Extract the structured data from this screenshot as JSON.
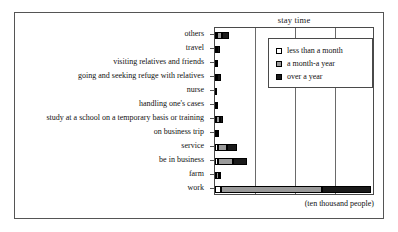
{
  "chart_data": {
    "type": "bar",
    "orientation": "horizontal",
    "stacked": true,
    "title": "stay time",
    "xlabel": "(ten thousand people)",
    "ylabel": "",
    "unit_caption": "(ten thousand people)",
    "grid": true,
    "gridlines_x": [
      0,
      25,
      50,
      75,
      100
    ],
    "xlim": [
      0,
      100
    ],
    "legend_position": "top-right",
    "categories": [
      "others",
      "travel",
      "visiting relatives and friends",
      "going and seeking refuge with relatives",
      "nurse",
      "handling one's cases",
      "study at a school on a temporary basis or training",
      "on business trip",
      "service",
      "be in business",
      "farm",
      "work"
    ],
    "series": [
      {
        "name": "less than a month",
        "color": "#ffffff",
        "values": [
          1.2,
          0.5,
          0.6,
          0.6,
          0.1,
          0.2,
          0.6,
          0.7,
          1.6,
          1.6,
          0.6,
          3.8
        ]
      },
      {
        "name": "a month-a year",
        "color": "#9a9a9a",
        "values": [
          3.2,
          0.6,
          0.2,
          0.9,
          0.1,
          0.2,
          2.3,
          0.3,
          5.9,
          9.6,
          2.0,
          63.0
        ]
      },
      {
        "name": "over a year",
        "color": "#1a1a1a",
        "values": [
          4.2,
          1.9,
          0.3,
          2.3,
          0.1,
          0.2,
          2.1,
          0.3,
          6.0,
          8.5,
          1.2,
          31.0
        ]
      }
    ],
    "totals": [
      8.6,
      3.0,
      1.1,
      3.8,
      0.3,
      0.6,
      5.0,
      1.3,
      13.5,
      19.7,
      3.8,
      97.8
    ]
  },
  "legend": {
    "items": [
      {
        "label": "less than a month",
        "swatch": "swatch-white"
      },
      {
        "label": "a month-a year",
        "swatch": "swatch-gray"
      },
      {
        "label": "over a year",
        "swatch": "swatch-black"
      }
    ]
  }
}
